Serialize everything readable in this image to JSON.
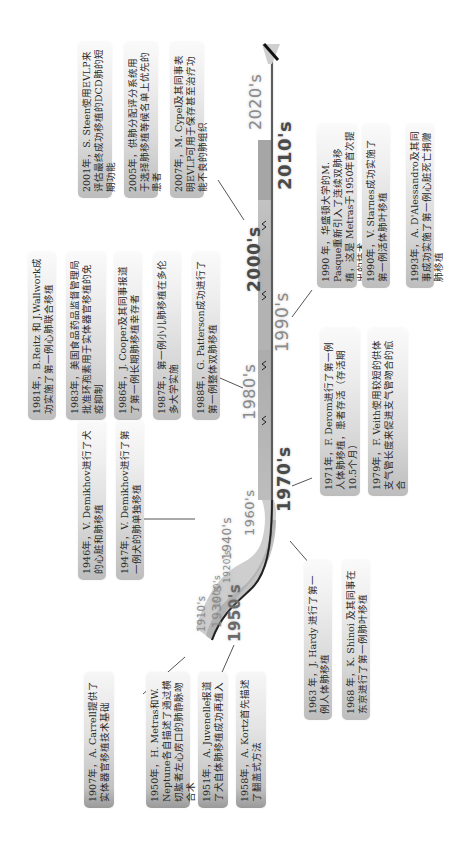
{
  "diagram": {
    "title": "",
    "orientation": "rotated -90deg (timeline runs bottom-left to top-right)",
    "colors": {
      "band_light": "#d9d9d9",
      "band_mid": "#b5b5b5",
      "band_dark": "#9c9c9c",
      "axis_line": "#5f5f5f",
      "axis_end": "#1a1a1a",
      "box_start": "#bdbdbd",
      "box_end": "#fafafa",
      "text": "#2a2a2a",
      "decade_label": "#8a8a8a"
    },
    "decades": [
      {
        "label": "1900's"
      },
      {
        "label": "1910's"
      },
      {
        "label": "1920's"
      },
      {
        "label": "1930's"
      },
      {
        "label": "1940's"
      },
      {
        "label": "1950's"
      },
      {
        "label": "1960's"
      },
      {
        "label": "1970's"
      },
      {
        "label": "1980's"
      },
      {
        "label": "1990's"
      },
      {
        "label": "2000's"
      },
      {
        "label": "2010's"
      },
      {
        "label": "2020's"
      }
    ],
    "events": [
      {
        "year": "1907",
        "text": "1907年，A. Carrell提供了实体器官移植技术基础"
      },
      {
        "year": "1946",
        "text": "1946年，V. Demikhov进行了犬的心脏和肺移植"
      },
      {
        "year": "1947",
        "text": "1947年，V. Demikhov进行了第一例犬的肺单独移植"
      },
      {
        "year": "1950",
        "text": "1950年，H. Metras和W. Neptune各自描述了通过横切肱者左心房口的肺静脉吻合术"
      },
      {
        "year": "1951",
        "text": "1951年，A. Juvenelle报道了犬自体肺移植成功再植入"
      },
      {
        "year": "1958",
        "text": "1958年，A. Kortz首先描述了翻盖式方法"
      },
      {
        "year": "1963",
        "text": "1963 年，J. Hardy 进行了第一例人体肺移植"
      },
      {
        "year": "1968",
        "text": "1968 年，K. Shinoi 及其同事在东京进行了第一例肺叶移植"
      },
      {
        "year": "1971",
        "text": "1971年，F. Derom进行了第一例人体肺移植，患者存活（存活期10.5个月）"
      },
      {
        "year": "1979",
        "text": "1979年，F. Veith使用较短的供体支气管长度来促进支气管吻合的愈合"
      },
      {
        "year": "1981",
        "text": "1981年，B.Reitz 和 J.Wallwork成功实施了第一例心肺联合移植"
      },
      {
        "year": "1983",
        "text": "1983年，美国食品药品监督管理局批准环孢素用于实体器官移植的免疫抑制"
      },
      {
        "year": "1986",
        "text": "1986年，J. Cooper及其同事报道了第一例长期肺移植幸存者"
      },
      {
        "year": "1987",
        "text": "1987年，第一例小儿肺移植在多伦多大学实施"
      },
      {
        "year": "1988",
        "text": "1988年，G. Patterson成功进行了第一例整体双肺移植"
      },
      {
        "year": "1990a",
        "text": "1990 年，华盛顿大学的M. Pasque重新引入了连续双肺移植，这是 Metras于1950年首次提出的技术"
      },
      {
        "year": "1990b",
        "text": "1990年，V. Starnes成功实施了第一例活体肺叶移植"
      },
      {
        "year": "1993",
        "text": "1993年，A. D'Alessandro及其同事成功实施了第一例心脏死亡捐赠肺移植"
      },
      {
        "year": "2001",
        "text": "2001年，S. Steen使用EVLP来评估最终成功移植的DCD肺的短期功能"
      },
      {
        "year": "2005",
        "text": "2005年，供肺分配评分系统用于选择肺移植等候名单上优先的患者"
      },
      {
        "year": "2007",
        "text": "2007年，M. Cypel及其同事表明EVLP可用于保存甚至治疗功能不良的肺组织"
      }
    ]
  }
}
